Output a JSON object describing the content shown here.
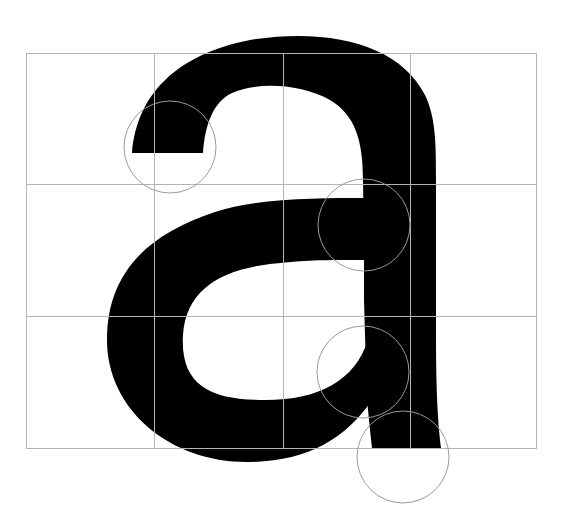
{
  "diagram": {
    "glyph": "a",
    "colors": {
      "background": "#ffffff",
      "glyph_fill": "#000000",
      "grid_line": "#b4b4b4",
      "circle_stroke": "#9a9a9a"
    },
    "grid": {
      "columns": 4,
      "rows": 3,
      "x_lines": [
        26,
        154,
        283,
        410,
        536
      ],
      "y_lines": [
        53,
        184,
        316,
        448
      ]
    },
    "guide_circles": [
      {
        "name": "terminal-circle",
        "cx": 170,
        "cy": 147,
        "r": 46
      },
      {
        "name": "crossbar-junction-circle",
        "cx": 364,
        "cy": 225,
        "r": 46
      },
      {
        "name": "bowl-junction-circle",
        "cx": 363,
        "cy": 372,
        "r": 46
      },
      {
        "name": "stem-foot-circle",
        "cx": 403,
        "cy": 457,
        "r": 46
      }
    ]
  }
}
